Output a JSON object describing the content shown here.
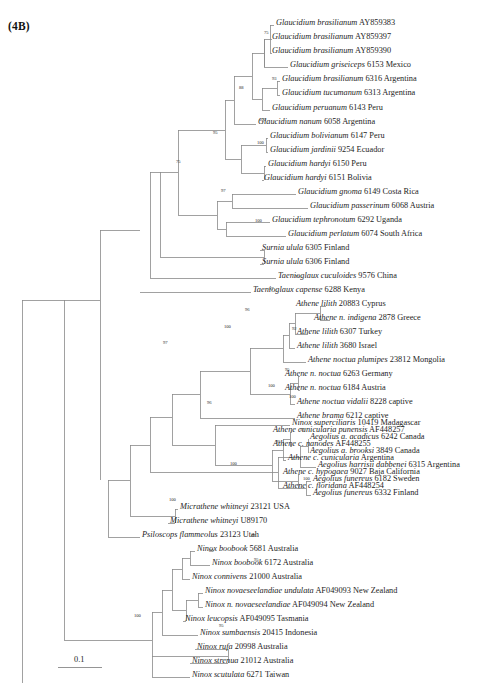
{
  "figure": {
    "panel_label": "(4B)",
    "scale_bar_label": "0.1",
    "scale_bar_value": 0.1,
    "line_color": "#8a8a8a",
    "text_color": "#1d1d1d"
  },
  "chart_data": {
    "type": "tree",
    "title": "(4B)",
    "xlabel": "",
    "ylabel": "",
    "scale_bar": {
      "label": "0.1",
      "value": 0.1
    },
    "outgroup": "Gallus",
    "tips": [
      {
        "genus_species": "Glaucidium brasilianum",
        "accession": "AY859383",
        "locality": ""
      },
      {
        "genus_species": "Glaucidium brasilianum",
        "accession": "AY859397",
        "locality": ""
      },
      {
        "genus_species": "Glaucidium brasilianum",
        "accession": "AY859390",
        "locality": ""
      },
      {
        "genus_species": "Glaucidium griseiceps",
        "accession": "6153",
        "locality": "Mexico"
      },
      {
        "genus_species": "Glaucidium brasilianum",
        "accession": "6316",
        "locality": "Argentina"
      },
      {
        "genus_species": "Glaucidium tucumanum",
        "accession": "6313",
        "locality": "Argentina"
      },
      {
        "genus_species": "Glaucidium peruanum",
        "accession": "6143",
        "locality": "Peru"
      },
      {
        "genus_species": "Glaucidium nanum",
        "accession": "6058",
        "locality": "Argentina"
      },
      {
        "genus_species": "Glaucidium bolivianum",
        "accession": "6147",
        "locality": "Peru"
      },
      {
        "genus_species": "Glaucidium jardinii",
        "accession": "9254",
        "locality": "Ecuador"
      },
      {
        "genus_species": "Glaucidium hardyi",
        "accession": "6150",
        "locality": "Peru"
      },
      {
        "genus_species": "Glaucidium hardyi",
        "accession": "6151",
        "locality": "Bolivia"
      },
      {
        "genus_species": "Glaucidium gnoma",
        "accession": "6149",
        "locality": "Costa Rica"
      },
      {
        "genus_species": "Glaucidium passerinum",
        "accession": "6068",
        "locality": "Austria"
      },
      {
        "genus_species": "Glaucidium tephronotum",
        "accession": "6292",
        "locality": "Uganda"
      },
      {
        "genus_species": "Glaucidium perlatum",
        "accession": "6074",
        "locality": "South Africa"
      },
      {
        "genus_species": "Surnia ulula",
        "accession": "6305",
        "locality": "Finland"
      },
      {
        "genus_species": "Surnia ulula",
        "accession": "6306",
        "locality": "Finland"
      },
      {
        "genus_species": "Taenioglaux cuculoides",
        "accession": "9576",
        "locality": "China"
      },
      {
        "genus_species": "Taenioglaux capense",
        "accession": "6288",
        "locality": "Kenya"
      },
      {
        "genus_species": "Athene lilith",
        "accession": "20883",
        "locality": "Cyprus"
      },
      {
        "genus_species": "Athene n. indigena",
        "accession": "2878",
        "locality": "Greece"
      },
      {
        "genus_species": "Athene lilith",
        "accession": "6307",
        "locality": "Turkey"
      },
      {
        "genus_species": "Athene lilith",
        "accession": "3680",
        "locality": "Israel"
      },
      {
        "genus_species": "Athene noctua plumipes",
        "accession": "23812",
        "locality": "Mongolia"
      },
      {
        "genus_species": "Athene n. noctua",
        "accession": "6263",
        "locality": "Germany"
      },
      {
        "genus_species": "Athene n. noctua",
        "accession": "6184",
        "locality": "Austria"
      },
      {
        "genus_species": "Athene noctua vidalii",
        "accession": "8228",
        "locality": "captive"
      },
      {
        "genus_species": "Athene brama",
        "accession": "6212",
        "locality": "captive"
      },
      {
        "genus_species": "Athene cunicularia punensis",
        "accession": "AF448257",
        "locality": ""
      },
      {
        "genus_species": "Athene c. nanodes",
        "accession": "AF448255",
        "locality": ""
      },
      {
        "genus_species": "Athene c. cunicularia",
        "accession": "",
        "locality": "Argentina"
      },
      {
        "genus_species": "Athene c. hypogaea",
        "accession": "9027",
        "locality": "Baja California"
      },
      {
        "genus_species": "Athene c. floridana",
        "accession": "AF448254",
        "locality": ""
      },
      {
        "genus_species": "Ninox superciliaris",
        "accession": "10419",
        "locality": "Madagascar"
      },
      {
        "genus_species": "Aegolius a. acadicus",
        "accession": "6242",
        "locality": "Canada"
      },
      {
        "genus_species": "Aegolius a. brooksi",
        "accession": "3849",
        "locality": "Canada"
      },
      {
        "genus_species": "Aegolius harrisii dabbenei",
        "accession": "6315",
        "locality": "Argentina"
      },
      {
        "genus_species": "Aegolius funereus",
        "accession": "6182",
        "locality": "Sweden"
      },
      {
        "genus_species": "Aegolius funereus",
        "accession": "6332",
        "locality": "Finland"
      },
      {
        "genus_species": "Micrathene whitneyi",
        "accession": "23121",
        "locality": "USA"
      },
      {
        "genus_species": "Micrathene whitneyi",
        "accession": "U89170",
        "locality": ""
      },
      {
        "genus_species": "Psiloscops flammeolus",
        "accession": "23123",
        "locality": "Utah"
      },
      {
        "genus_species": "Ninox boobook",
        "accession": "5681",
        "locality": "Australia"
      },
      {
        "genus_species": "Ninox boobook",
        "accession": "6172",
        "locality": "Australia"
      },
      {
        "genus_species": "Ninox connivens",
        "accession": "21000",
        "locality": "Australia"
      },
      {
        "genus_species": "Ninox novaeseelandiae undulata",
        "accession": "AF049093",
        "locality": "New Zealand"
      },
      {
        "genus_species": "Ninox n. novaeseelandiae",
        "accession": "AF049094",
        "locality": "New Zealand"
      },
      {
        "genus_species": "Ninox leucopsis",
        "accession": "AF049095",
        "locality": "Tasmania"
      },
      {
        "genus_species": "Ninox sumbaensis",
        "accession": "20415",
        "locality": "Indonesia"
      },
      {
        "genus_species": "Ninox rufa",
        "accession": "20998",
        "locality": "Australia"
      },
      {
        "genus_species": "Ninox strenua",
        "accession": "21012",
        "locality": "Australia"
      },
      {
        "genus_species": "Ninox scutulata",
        "accession": "6271",
        "locality": "Taiwan"
      },
      {
        "genus_species": "Gallus",
        "accession": "",
        "locality": ""
      }
    ],
    "support_values": [
      {
        "value": "75",
        "x": 264,
        "y": 34
      },
      {
        "value": "93",
        "x": 272,
        "y": 80
      },
      {
        "value": "88",
        "x": 239,
        "y": 89
      },
      {
        "value": "100",
        "x": 259,
        "y": 121
      },
      {
        "value": "100",
        "x": 257,
        "y": 144
      },
      {
        "value": "95",
        "x": 213,
        "y": 134
      },
      {
        "value": "75",
        "x": 176,
        "y": 163
      },
      {
        "value": "97",
        "x": 221,
        "y": 192
      },
      {
        "value": "100",
        "x": 255,
        "y": 222
      },
      {
        "value": "95",
        "x": 295,
        "y": 278
      },
      {
        "value": "97",
        "x": 269,
        "y": 290
      },
      {
        "value": "96",
        "x": 245,
        "y": 311
      },
      {
        "value": "100",
        "x": 224,
        "y": 328
      },
      {
        "value": "92",
        "x": 292,
        "y": 330
      },
      {
        "value": "95",
        "x": 285,
        "y": 371
      },
      {
        "value": "100",
        "x": 268,
        "y": 387
      },
      {
        "value": "100",
        "x": 289,
        "y": 398
      },
      {
        "value": "96",
        "x": 207,
        "y": 404
      },
      {
        "value": "97",
        "x": 163,
        "y": 344
      },
      {
        "value": "97",
        "x": 300,
        "y": 431
      },
      {
        "value": "95",
        "x": 276,
        "y": 443
      },
      {
        "value": "100",
        "x": 230,
        "y": 465
      },
      {
        "value": "100",
        "x": 303,
        "y": 480
      },
      {
        "value": "100",
        "x": 169,
        "y": 501
      },
      {
        "value": "97",
        "x": 251,
        "y": 537
      },
      {
        "value": "95",
        "x": 254,
        "y": 561
      },
      {
        "value": "80",
        "x": 209,
        "y": 552
      },
      {
        "value": "95",
        "x": 219,
        "y": 627
      },
      {
        "value": "100",
        "x": 134,
        "y": 617
      }
    ]
  },
  "tip_labels": [
    {
      "name": "Glaucidium brasilianum",
      "rest": " AY859383",
      "x": 276,
      "y": 25
    },
    {
      "name": "Glaucidium brasilianum",
      "rest": " AY859397",
      "x": 272,
      "y": 39
    },
    {
      "name": "Glaucidium brasilianum",
      "rest": " AY859390",
      "x": 272,
      "y": 53
    },
    {
      "name": "Glaucidium griseiceps",
      "rest": " 6153 Mexico",
      "x": 290,
      "y": 67
    },
    {
      "name": "Glaucidium brasilianum",
      "rest": " 6316 Argentina",
      "x": 282,
      "y": 81
    },
    {
      "name": "Glaucidium tucumanum",
      "rest": " 6313 Argentina",
      "x": 282,
      "y": 95
    },
    {
      "name": "Glaucidium peruanum",
      "rest": " 6143 Peru",
      "x": 272,
      "y": 110
    },
    {
      "name": "Glaucidium nanum",
      "rest": " 6058 Argentina",
      "x": 258,
      "y": 124
    },
    {
      "name": "Glaucidium bolivianum",
      "rest": " 6147 Peru",
      "x": 270,
      "y": 138
    },
    {
      "name": "Glaucidium jardinii",
      "rest": " 9254 Ecuador",
      "x": 270,
      "y": 152
    },
    {
      "name": "Glaucidium hardyi",
      "rest": " 6150 Peru",
      "x": 268,
      "y": 166
    },
    {
      "name": "Glaucidium hardyi",
      "rest": " 6151 Bolivia",
      "x": 264,
      "y": 180
    },
    {
      "name": "Glaucidium gnoma",
      "rest": " 6149 Costa Rica",
      "x": 298,
      "y": 194
    },
    {
      "name": "Glaucidium passerinum",
      "rest": " 6068 Austria",
      "x": 310,
      "y": 208
    },
    {
      "name": "Glaucidium tephronotum",
      "rest": " 6292 Uganda",
      "x": 272,
      "y": 222
    },
    {
      "name": "Glaucidium perlatum",
      "rest": " 6074 South Africa",
      "x": 288,
      "y": 236
    },
    {
      "name": "Surnia ulula",
      "rest": " 6305 Finland",
      "x": 262,
      "y": 250
    },
    {
      "name": "Surnia ulula",
      "rest": " 6306 Finland",
      "x": 262,
      "y": 264
    },
    {
      "name": "Taenioglaux cuculoides",
      "rest": " 9576 China",
      "x": 278,
      "y": 278
    },
    {
      "name": "Taenioglaux capense",
      "rest": " 6288 Kenya",
      "x": 253,
      "y": 292
    },
    {
      "name": "Athene lilith",
      "rest": " 20883 Cyprus",
      "x": 296,
      "y": 306
    },
    {
      "name": "Athene n. indigena",
      "rest": " 2878 Greece",
      "x": 314,
      "y": 320
    },
    {
      "name": "Athene lilith",
      "rest": " 6307 Turkey",
      "x": 297,
      "y": 334
    },
    {
      "name": "Athene lilith",
      "rest": " 3680 Israel",
      "x": 297,
      "y": 348
    },
    {
      "name": "Athene noctua plumipes",
      "rest": " 23812 Mongolia",
      "x": 308,
      "y": 362
    },
    {
      "name": "Athene n. noctua",
      "rest": " 6263 Germany",
      "x": 285,
      "y": 376
    },
    {
      "name": "Athene n. noctua",
      "rest": " 6184 Austria",
      "x": 285,
      "y": 390
    },
    {
      "name": "Athene noctua vidalii",
      "rest": " 8228 captive",
      "x": 297,
      "y": 404
    },
    {
      "name": "Athene brama",
      "rest": " 6212 captive",
      "x": 297,
      "y": 418
    },
    {
      "name": "Athene cunicularia punensis",
      "rest": " AF448257",
      "x": 273,
      "y": 432
    },
    {
      "name": "Athene c. nanodes",
      "rest": " AF448255",
      "x": 273,
      "y": 446
    },
    {
      "name": "Athene c. cunicularia",
      "rest": " Argentina",
      "x": 288,
      "y": 460
    },
    {
      "name": "Athene c. hypogaea",
      "rest": " 9027 Baja California",
      "x": 283,
      "y": 474
    },
    {
      "name": "Athene c. floridana",
      "rest": " AF448254",
      "x": 283,
      "y": 488
    },
    {
      "name": "Ninox superciliaris",
      "rest": " 10419 Madagascar",
      "x": 292,
      "y": 425
    },
    {
      "name": "Aegolius a. acadicus",
      "rest": " 6242 Canada",
      "x": 310,
      "y": 439
    },
    {
      "name": "Aegolius a. brooksi",
      "rest": " 3849 Canada",
      "x": 310,
      "y": 453
    },
    {
      "name": "Aegolius harrisii dabbenei",
      "rest": " 6315 Argentina",
      "x": 318,
      "y": 467
    },
    {
      "name": "Aegolius funereus",
      "rest": " 6182 Sweden",
      "x": 313,
      "y": 481
    },
    {
      "name": "Aegolius funereus",
      "rest": " 6332 Finland",
      "x": 313,
      "y": 495
    },
    {
      "name": "Micrathene whitneyi",
      "rest": " 23121 USA",
      "x": 180,
      "y": 509
    },
    {
      "name": "Micrathene whitneyi",
      "rest": " U89170",
      "x": 170,
      "y": 523
    },
    {
      "name": "Psiloscops flammeolus",
      "rest": " 23123 Utah",
      "x": 142,
      "y": 537
    },
    {
      "name": "Ninox boobook",
      "rest": " 5681 Australia",
      "x": 197,
      "y": 551
    },
    {
      "name": "Ninox boobook",
      "rest": " 6172 Australia",
      "x": 212,
      "y": 565
    },
    {
      "name": "Ninox connivens",
      "rest": " 21000 Australia",
      "x": 192,
      "y": 579
    },
    {
      "name": "Ninox novaeseelandiae undulata",
      "rest": " AF049093 New Zealand",
      "x": 205,
      "y": 593
    },
    {
      "name": "Ninox n. novaeseelandiae",
      "rest": " AF049094 New Zealand",
      "x": 205,
      "y": 607
    },
    {
      "name": "Ninox leucopsis",
      "rest": " AF049095 Tasmania",
      "x": 185,
      "y": 621
    },
    {
      "name": "Ninox sumbaensis",
      "rest": " 20415 Indonesia",
      "x": 200,
      "y": 635
    },
    {
      "name": "Ninox rufa",
      "rest": " 20998 Australia",
      "x": 197,
      "y": 649
    },
    {
      "name": "Ninox strenua",
      "rest": " 21012 Australia",
      "x": 192,
      "y": 663
    },
    {
      "name": "Ninox scutulata",
      "rest": " 6271 Taiwan",
      "x": 192,
      "y": 677
    },
    {
      "name": "Gallus",
      "rest": "",
      "x": 401,
      "y": 691
    }
  ]
}
